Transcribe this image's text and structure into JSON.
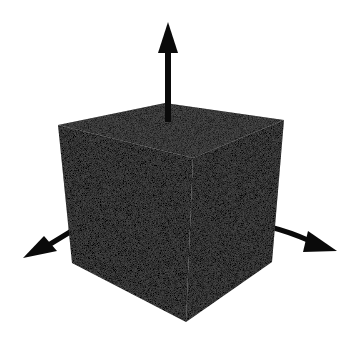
{
  "canvas": {
    "width": 357,
    "height": 352,
    "background": "#ffffff"
  },
  "cube": {
    "description": "dark shaded 3D cube with coordinate axes",
    "vertices": {
      "top_back": [
        165,
        103
      ],
      "top_left": [
        58,
        125
      ],
      "top_right": [
        284,
        120
      ],
      "top_front": [
        193,
        158
      ],
      "bottom_left": [
        72,
        263
      ],
      "bottom_right": [
        272,
        262
      ],
      "bottom_front": [
        186,
        322
      ]
    },
    "colors": {
      "top_face": "#1c1c1c",
      "left_face": "#050505",
      "right_face": "#0e0e0e"
    }
  },
  "axes": [
    {
      "name": "up-axis",
      "from": [
        168,
        104
      ],
      "tip": [
        168,
        22
      ],
      "color": "#0a0a0a"
    },
    {
      "name": "left-axis",
      "from": [
        70,
        232
      ],
      "tip": [
        23,
        258
      ],
      "color": "#0a0a0a"
    },
    {
      "name": "right-axis",
      "from": [
        272,
        226
      ],
      "tip": [
        337,
        251
      ],
      "color": "#0a0a0a"
    }
  ]
}
